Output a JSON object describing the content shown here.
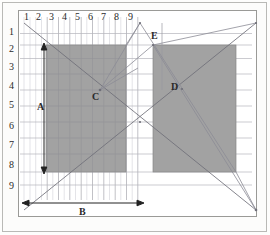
{
  "figure": {
    "frame": {
      "stroke": "#9a9a97",
      "fill": "#ffffff"
    },
    "grid": {
      "minor_color": "#cfcfd4",
      "major_color": "#9a9aa2",
      "cell": 11.6,
      "origin_x": 19.5,
      "origin_y": 18.5,
      "cols": 19,
      "rows": 16
    },
    "column_labels": [
      "1",
      "2",
      "3",
      "4",
      "5",
      "6",
      "7",
      "8",
      "9"
    ],
    "row_labels": [
      "1",
      "2",
      "3",
      "4",
      "5",
      "6",
      "7",
      "8",
      "9"
    ],
    "rect_fill": "#a0a0a0",
    "rect_stroke": "#7d7d7d",
    "rectangles": [
      {
        "name": "left-rectangle",
        "x": 42.0,
        "y": 41.0,
        "w": 80.0,
        "h": 128.0
      },
      {
        "name": "right-rectangle",
        "x": 149.0,
        "y": 41.0,
        "w": 83.0,
        "h": 127.0
      }
    ],
    "points": [
      {
        "name": "point-c",
        "label": "C",
        "x": 96.0,
        "y": 86.0,
        "lx": 89.0,
        "ly": 88.0
      },
      {
        "name": "point-d",
        "label": "D",
        "x": 178.0,
        "y": 85.0,
        "lx": 168.0,
        "ly": 80.0
      },
      {
        "name": "point-e",
        "label": "E",
        "x": 144.0,
        "y": 37.0,
        "lx": 148.0,
        "ly": 27.0
      }
    ],
    "dimensions": [
      {
        "name": "dimension-a",
        "label": "A",
        "orientation": "vertical",
        "x": 40.0,
        "y1": 42.0,
        "y2": 168.0,
        "lx": 34.0,
        "ly": 101.0
      },
      {
        "name": "dimension-b",
        "label": "B",
        "orientation": "horizontal",
        "y": 199.0,
        "x1": 20.0,
        "x2": 138.0,
        "lx": 75.0,
        "ly": 205.0
      }
    ],
    "line_color": "#8a8a92",
    "line_color_dark": "#6e6e76",
    "construction_lines": [
      {
        "name": "diag-top-left-to-bottom-right",
        "x1": 20.0,
        "y1": 19.0,
        "x2": 252.0,
        "y2": 206.0
      },
      {
        "name": "diag-bottom-left-to-top-right",
        "x1": 20.0,
        "y1": 206.0,
        "x2": 252.0,
        "y2": 19.0
      },
      {
        "name": "line-c-to-apex",
        "x1": 96.0,
        "y1": 86.0,
        "x2": 136.0,
        "y2": 19.0
      },
      {
        "name": "line-c-to-e-top",
        "x1": 96.0,
        "y1": 86.0,
        "x2": 149.0,
        "y2": 41.0
      },
      {
        "name": "line-c-to-right-edge",
        "x1": 96.0,
        "y1": 86.0,
        "x2": 138.0,
        "y2": 62.0
      },
      {
        "name": "apex-to-left-rect-corner",
        "x1": 136.0,
        "y1": 19.0,
        "x2": 122.0,
        "y2": 41.0
      },
      {
        "name": "apex-to-down-right",
        "x1": 136.0,
        "y1": 19.0,
        "x2": 232.0,
        "y2": 168.0
      },
      {
        "name": "right-rect-corner-to-bottom-right",
        "x1": 149.0,
        "y1": 41.0,
        "x2": 252.0,
        "y2": 206.0
      },
      {
        "name": "bottom-right-to-right-rect-bottom",
        "x1": 252.0,
        "y1": 206.0,
        "x2": 232.0,
        "y2": 168.0
      },
      {
        "name": "mid-cross-point",
        "x1": 138.0,
        "y1": 118.0,
        "x2": 149.0,
        "y2": 41.0
      }
    ]
  }
}
